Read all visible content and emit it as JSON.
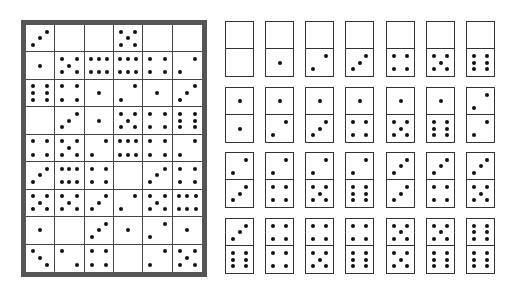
{
  "board": {
    "rows": 9,
    "cols": 6,
    "cells": [
      [
        3,
        0,
        0,
        5,
        0,
        0
      ],
      [
        1,
        5,
        6,
        6,
        4,
        2
      ],
      [
        6,
        4,
        1,
        2,
        1,
        3
      ],
      [
        0,
        3,
        1,
        5,
        4,
        6
      ],
      [
        4,
        5,
        2,
        6,
        4,
        2
      ],
      [
        3,
        6,
        4,
        0,
        3,
        4
      ],
      [
        5,
        5,
        3,
        2,
        5,
        6
      ],
      [
        1,
        0,
        3,
        1,
        2,
        1
      ],
      [
        3,
        2,
        4,
        0,
        2,
        5
      ]
    ],
    "frame_color": "#555555"
  },
  "domino_set": {
    "columns_x": [
      225,
      265,
      305,
      345,
      386,
      426,
      466
    ],
    "rows_y": [
      21,
      87,
      152,
      218
    ],
    "rows": [
      [
        [
          0,
          0
        ],
        [
          0,
          1
        ],
        [
          0,
          2
        ],
        [
          0,
          3
        ],
        [
          0,
          4
        ],
        [
          0,
          5
        ],
        [
          0,
          6
        ]
      ],
      [
        [
          1,
          1
        ],
        [
          1,
          2
        ],
        [
          1,
          3
        ],
        [
          1,
          4
        ],
        [
          1,
          5
        ],
        [
          1,
          6
        ],
        [
          2,
          2
        ]
      ],
      [
        [
          2,
          3
        ],
        [
          2,
          4
        ],
        [
          2,
          5
        ],
        [
          2,
          6
        ],
        [
          3,
          3
        ],
        [
          3,
          4
        ],
        [
          3,
          5
        ]
      ],
      [
        [
          3,
          6
        ],
        [
          4,
          4
        ],
        [
          4,
          5
        ],
        [
          4,
          6
        ],
        [
          5,
          5
        ],
        [
          5,
          6
        ],
        [
          6,
          6
        ]
      ]
    ]
  },
  "pip_color": "#111111"
}
